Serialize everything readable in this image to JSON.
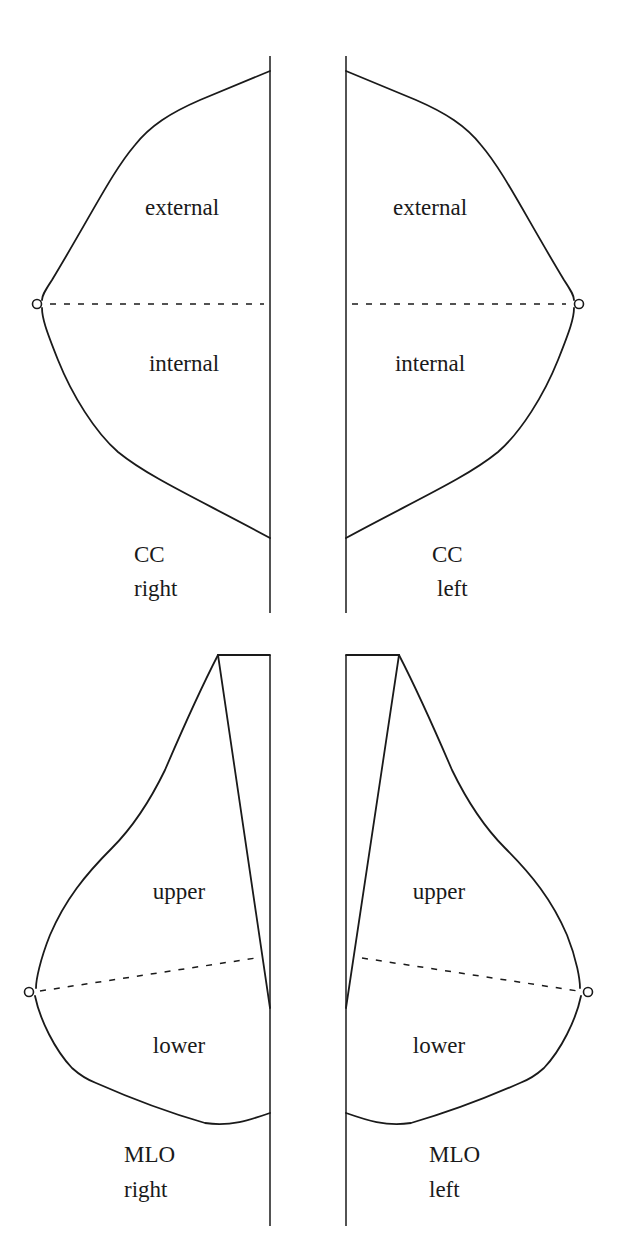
{
  "diagram": {
    "type": "mammography-view-schematic",
    "panels": [
      {
        "id": "cc-right",
        "view": "CC",
        "side": "right",
        "regions": [
          "external",
          "internal"
        ],
        "caption_line1": "CC",
        "caption_line2": "right"
      },
      {
        "id": "cc-left",
        "view": "CC",
        "side": "left",
        "regions": [
          "external",
          "internal"
        ],
        "caption_line1": "CC",
        "caption_line2": "left"
      },
      {
        "id": "mlo-right",
        "view": "MLO",
        "side": "right",
        "regions": [
          "upper",
          "lower"
        ],
        "caption_line1": "MLO",
        "caption_line2": "right"
      },
      {
        "id": "mlo-left",
        "view": "MLO",
        "side": "left",
        "regions": [
          "upper",
          "lower"
        ],
        "caption_line1": "MLO",
        "caption_line2": "left"
      }
    ]
  },
  "labels": {
    "cc_right_external": "external",
    "cc_right_internal": "internal",
    "cc_left_external": "external",
    "cc_left_internal": "internal",
    "cc_right_caption_1": "CC",
    "cc_right_caption_2": "right",
    "cc_left_caption_1": "CC",
    "cc_left_caption_2": "left",
    "mlo_right_upper": "upper",
    "mlo_right_lower": "lower",
    "mlo_left_upper": "upper",
    "mlo_left_lower": "lower",
    "mlo_right_caption_1": "MLO",
    "mlo_right_caption_2": "right",
    "mlo_left_caption_1": "MLO",
    "mlo_left_caption_2": "left"
  },
  "colors": {
    "stroke": "#1a1a1a",
    "background": "#ffffff"
  }
}
